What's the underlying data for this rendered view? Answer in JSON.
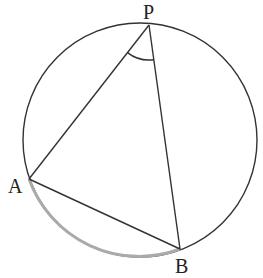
{
  "diagram": {
    "type": "circle-inscribed-angle",
    "circle": {
      "cx": 140,
      "cy": 140,
      "r": 117,
      "stroke": "#333333"
    },
    "points": {
      "P": {
        "x": 149,
        "y": 25,
        "label": "P"
      },
      "A": {
        "x": 29,
        "y": 179,
        "label": "A"
      },
      "B": {
        "x": 180,
        "y": 249,
        "label": "B"
      }
    },
    "segments": [
      {
        "from": "P",
        "to": "A"
      },
      {
        "from": "P",
        "to": "B"
      },
      {
        "from": "A",
        "to": "B"
      }
    ],
    "highlighted_arc": {
      "from": "A",
      "to": "B",
      "color": "#aaaaaa",
      "description": "minor arc AB"
    },
    "angle_mark": {
      "vertex": "P",
      "between": [
        "A",
        "B"
      ],
      "radius": 35
    },
    "labels": {
      "P": "P",
      "A": "A",
      "B": "B"
    }
  }
}
